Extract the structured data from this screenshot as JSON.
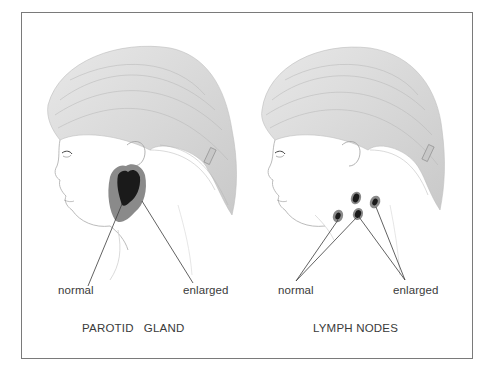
{
  "figure": {
    "panels": [
      {
        "id": "parotid",
        "caption": "PAROTID   GLAND",
        "labels": {
          "normal": "normal",
          "enlarged": "enlarged"
        },
        "colors": {
          "normal_gland": "#1a1a1a",
          "enlarged_gland": "#8a8a8a"
        }
      },
      {
        "id": "lymph",
        "caption": "LYMPH NODES",
        "labels": {
          "normal": "normal",
          "enlarged": "enlarged"
        },
        "colors": {
          "node": "#1a1a1a",
          "node_halo": "#8a8a8a"
        }
      }
    ],
    "frame_color": "#7a7a7a",
    "line_color": "#3a3a3a"
  }
}
